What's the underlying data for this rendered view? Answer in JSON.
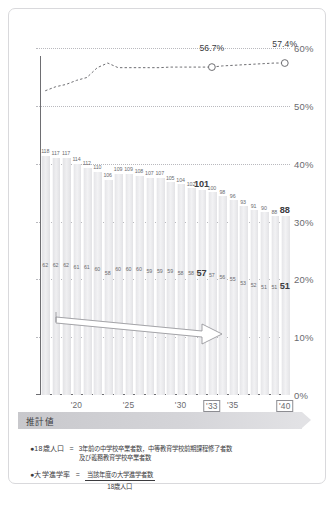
{
  "chart_data": {
    "type": "bar",
    "title": "",
    "xlabel": "",
    "ylabel": "",
    "ylim": [
      0,
      60
    ],
    "ytick_labels": [
      "60%",
      "50%",
      "40%",
      "30%",
      "20%",
      "10%",
      "0%"
    ],
    "ytick_values": [
      60,
      50,
      40,
      30,
      20,
      10,
      0
    ],
    "grid": true,
    "legend_position": "below-plot",
    "categories": [
      "2017",
      "2018",
      "2019",
      "2020",
      "2021",
      "2022",
      "2023",
      "2024",
      "2025",
      "2026",
      "2027",
      "2028",
      "2029",
      "2030",
      "2031",
      "2032",
      "2033",
      "2034",
      "2035",
      "2036",
      "2037",
      "2038",
      "2039",
      "2040"
    ],
    "xtick_labels": [
      {
        "label": "'20",
        "index": 3,
        "boxed": false
      },
      {
        "label": "'25",
        "index": 8,
        "boxed": false
      },
      {
        "label": "'30",
        "index": 13,
        "boxed": false
      },
      {
        "label": "'33",
        "index": 16,
        "boxed": true
      },
      {
        "label": "'35",
        "index": 18,
        "boxed": false
      },
      {
        "label": "'40",
        "index": 23,
        "boxed": true
      }
    ],
    "series": [
      {
        "name": "18歳人口",
        "unit": "万人",
        "values": [
          118,
          117,
          117,
          114,
          112,
          110,
          106,
          109,
          109,
          108,
          107,
          107,
          105,
          104,
          102,
          101,
          100,
          98,
          96,
          93,
          91,
          90,
          88,
          88
        ],
        "highlight_index": [
          15,
          23
        ],
        "label_position": "above-bar"
      },
      {
        "name": "大学進学者数",
        "unit": "万人",
        "values": [
          62,
          62,
          62,
          61,
          61,
          60,
          58,
          60,
          60,
          60,
          59,
          59,
          59,
          58,
          58,
          57,
          57,
          56,
          55,
          53,
          52,
          51,
          51,
          51
        ],
        "highlight_index": [
          15,
          23
        ],
        "label_position": "mid-bar"
      },
      {
        "name": "大学進学率",
        "type": "line",
        "unit": "%",
        "values": [
          52.6,
          53.3,
          53.7,
          54.4,
          54.9,
          56.6,
          57.4,
          56.6,
          56.6,
          56.6,
          56.6,
          56.6,
          56.7,
          56.7,
          56.7,
          56.7,
          56.7,
          56.9,
          57.0,
          57.1,
          57.2,
          57.3,
          57.4,
          57.4
        ],
        "point_labels": [
          {
            "index": 16,
            "text": "56.7%"
          },
          {
            "index": 23,
            "text": "57.4%"
          }
        ],
        "markers": [
          16,
          23
        ],
        "style": "dotted"
      }
    ],
    "estimate_band": {
      "label": "推計値",
      "start_index": 3,
      "end_index": 23
    },
    "annotations": [
      {
        "type": "arrow",
        "direction": "down-right",
        "from_index": 3,
        "to_index": 16
      }
    ]
  },
  "legend": {
    "items": [
      {
        "bullet": "●",
        "name": "18歳人口",
        "equals": "=",
        "body_line1": "3年前の中学校卒業者数，中等教育学校前期課程修了者数",
        "body_line2": "及び義務教育学校卒業者数"
      },
      {
        "bullet": "●",
        "name": "大学進学率",
        "equals": "=",
        "numerator": "当該年度の大学進学者数",
        "denominator": "18歳人口"
      }
    ]
  }
}
